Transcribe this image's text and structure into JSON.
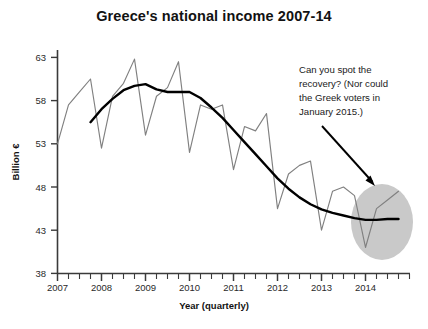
{
  "figure": {
    "title": "Greece's national income 2007-14",
    "annotation": {
      "lines": [
        "Can you spot the",
        "recovery? (Nor could",
        "the Greek voters in",
        "January 2015.)"
      ]
    },
    "colors": {
      "series_line": "#808080",
      "trend_line": "#000000",
      "highlight_ellipse": "#c9c9c9",
      "axis": "#3a3a3a",
      "text": "#121212",
      "background": "#ffffff"
    }
  },
  "chart_data": {
    "type": "line",
    "title": "Greece's national income 2007-14",
    "xlabel": "Year (quarterly)",
    "ylabel": "Billion €",
    "xlim": [
      2007.0,
      2015.0
    ],
    "ylim": [
      38,
      63
    ],
    "yticks": [
      38,
      43,
      48,
      53,
      58,
      63
    ],
    "xticks": [
      2007,
      2008,
      2009,
      2010,
      2011,
      2012,
      2013,
      2014
    ],
    "minor_ticks": "quarterly",
    "grid": false,
    "legend": "none",
    "x": [
      2007.0,
      2007.25,
      2007.5,
      2007.75,
      2008.0,
      2008.25,
      2008.5,
      2008.75,
      2009.0,
      2009.25,
      2009.5,
      2009.75,
      2010.0,
      2010.25,
      2010.5,
      2010.75,
      2011.0,
      2011.25,
      2011.5,
      2011.75,
      2012.0,
      2012.25,
      2012.5,
      2012.75,
      2013.0,
      2013.25,
      2013.5,
      2013.75,
      2014.0,
      2014.25,
      2014.5,
      2014.75
    ],
    "series": [
      {
        "name": "National income (quarterly, not seasonally adjusted)",
        "style": "thin-gray",
        "values": [
          53.0,
          57.5,
          59.0,
          60.5,
          52.5,
          58.5,
          60.0,
          62.8,
          54.0,
          58.5,
          59.5,
          62.5,
          52.0,
          57.5,
          57.0,
          57.5,
          50.0,
          55.0,
          54.5,
          56.5,
          45.5,
          49.5,
          50.5,
          51.0,
          43.0,
          47.5,
          48.0,
          47.0,
          41.0,
          45.5,
          46.5,
          47.5
        ]
      },
      {
        "name": "Trend (smoothed)",
        "style": "thick-black",
        "x": [
          2007.75,
          2008.0,
          2008.25,
          2008.5,
          2008.75,
          2009.0,
          2009.25,
          2009.5,
          2009.75,
          2010.0,
          2010.25,
          2010.5,
          2010.75,
          2011.0,
          2011.25,
          2011.5,
          2011.75,
          2012.0,
          2012.25,
          2012.5,
          2012.75,
          2013.0,
          2013.25,
          2013.5,
          2013.75,
          2014.0,
          2014.25,
          2014.5,
          2014.75
        ],
        "values": [
          55.5,
          57.0,
          58.2,
          59.2,
          59.7,
          59.9,
          59.3,
          59.0,
          59.0,
          59.0,
          58.3,
          57.2,
          56.0,
          54.6,
          53.2,
          51.8,
          50.4,
          49.0,
          47.8,
          46.8,
          46.0,
          45.4,
          45.0,
          44.7,
          44.4,
          44.2,
          44.2,
          44.3,
          44.3
        ]
      }
    ],
    "annotations": [
      {
        "name": "recovery-callout",
        "text": "Can you spot the recovery? (Nor could the Greek voters in January 2015.)",
        "arrow_from": [
          2013.85,
          59.5
        ],
        "arrow_to": [
          2014.45,
          48.5
        ]
      },
      {
        "name": "highlight-ellipse",
        "shape": "ellipse",
        "center_x": 2014.45,
        "center_y": 44.5,
        "note": "Gray oval highlighting the flat 2014 end of the trend"
      }
    ]
  }
}
